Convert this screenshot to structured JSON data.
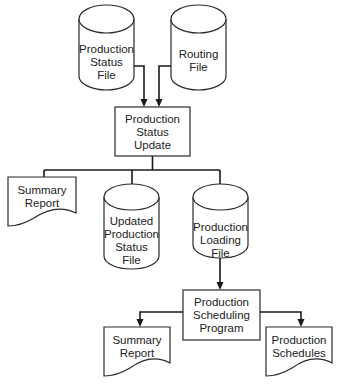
{
  "diagram": {
    "title": "",
    "nodes": {
      "production_status_file": {
        "type": "cylinder",
        "lines": [
          "Production",
          "Status",
          "File"
        ]
      },
      "routing_file": {
        "type": "cylinder",
        "lines": [
          "Routing",
          "File"
        ]
      },
      "production_status_update": {
        "type": "process",
        "lines": [
          "Production",
          "Status",
          "Update"
        ]
      },
      "summary_report_1": {
        "type": "document",
        "lines": [
          "Summary",
          "Report"
        ]
      },
      "updated_production_status_file": {
        "type": "cylinder",
        "lines": [
          "Updated",
          "Production",
          "Status",
          "File"
        ]
      },
      "production_loading_file": {
        "type": "cylinder",
        "lines": [
          "Production",
          "Loading",
          "File"
        ]
      },
      "production_scheduling_program": {
        "type": "process",
        "lines": [
          "Production",
          "Scheduling",
          "Program"
        ]
      },
      "summary_report_2": {
        "type": "document",
        "lines": [
          "Summary",
          "Report"
        ]
      },
      "production_schedules": {
        "type": "document",
        "lines": [
          "Production",
          "Schedules"
        ]
      }
    },
    "edges": [
      {
        "from": "production_status_file",
        "to": "production_status_update",
        "arrow": true
      },
      {
        "from": "routing_file",
        "to": "production_status_update",
        "arrow": true
      },
      {
        "from": "production_status_update",
        "to": "summary_report_1",
        "arrow": false
      },
      {
        "from": "production_status_update",
        "to": "updated_production_status_file",
        "arrow": false
      },
      {
        "from": "production_status_update",
        "to": "production_loading_file",
        "arrow": false
      },
      {
        "from": "production_loading_file",
        "to": "production_scheduling_program",
        "arrow": true
      },
      {
        "from": "production_scheduling_program",
        "to": "summary_report_2",
        "arrow": true
      },
      {
        "from": "production_scheduling_program",
        "to": "production_schedules",
        "arrow": true
      }
    ]
  }
}
